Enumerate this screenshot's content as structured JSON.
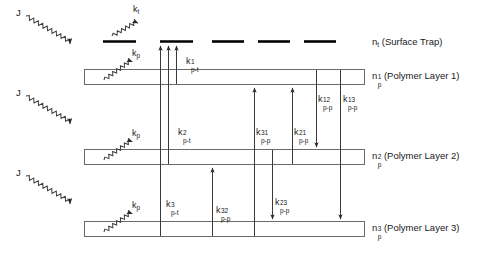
{
  "figure": {
    "type": "energy-level-kinetics-diagram",
    "background_color": "#ffffff",
    "line_color": "#3a3a3a",
    "trap_color": "#000000",
    "text_color": "#1a1a1a"
  },
  "trap_level": {
    "name": "surface-trap-level",
    "label_base": "n",
    "label_sub": "t",
    "label_paren": " (Surface Trap)",
    "segment_count": 5
  },
  "layers": [
    {
      "id": "polymer-layer-1",
      "label_base": "n",
      "label_sub": "p",
      "label_sup": "1",
      "label_paren": " (Polymer Layer 1)"
    },
    {
      "id": "polymer-layer-2",
      "label_base": "n",
      "label_sub": "p",
      "label_sup": "2",
      "label_paren": " (Polymer Layer 2)"
    },
    {
      "id": "polymer-layer-3",
      "label_base": "n",
      "label_sub": "p",
      "label_sup": "3",
      "label_paren": " (Polymer Layer 3)"
    }
  ],
  "excitation": {
    "label": "J",
    "count": 3,
    "description": "incident pump flux wavy arrows"
  },
  "emission": {
    "trap": {
      "base": "k",
      "sub": "t"
    },
    "polymer": {
      "base": "k",
      "sub": "p"
    },
    "polymer_count": 3
  },
  "rates": {
    "trapping": [
      {
        "id": "k-p-t-1",
        "base": "k",
        "sub": "p-t",
        "sup": "1"
      },
      {
        "id": "k-p-t-2",
        "base": "k",
        "sub": "p-t",
        "sup": "2"
      },
      {
        "id": "k-p-t-3",
        "base": "k",
        "sub": "p-t",
        "sup": "3"
      }
    ],
    "transfer": [
      {
        "id": "k-p-p-31",
        "base": "k",
        "sub": "p-p",
        "sup": "31"
      },
      {
        "id": "k-p-p-21",
        "base": "k",
        "sub": "p-p",
        "sup": "21"
      },
      {
        "id": "k-p-p-12",
        "base": "k",
        "sub": "p-p",
        "sup": "12"
      },
      {
        "id": "k-p-p-13",
        "base": "k",
        "sub": "p-p",
        "sup": "13"
      },
      {
        "id": "k-p-p-32",
        "base": "k",
        "sub": "p-p",
        "sup": "32"
      },
      {
        "id": "k-p-p-23",
        "base": "k",
        "sub": "p-p",
        "sup": "23"
      }
    ]
  }
}
